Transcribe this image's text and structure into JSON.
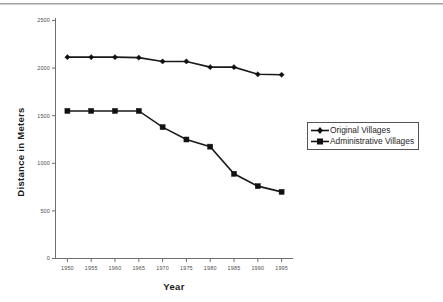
{
  "chart_data": {
    "type": "line",
    "title": "",
    "xlabel": "Year",
    "ylabel": "Distance in Meters",
    "x": [
      1950,
      1955,
      1960,
      1965,
      1970,
      1975,
      1980,
      1985,
      1990,
      1995
    ],
    "categories": [
      "1950",
      "1955",
      "1960",
      "1965",
      "1970",
      "1975",
      "1980",
      "1985",
      "1990",
      "1995"
    ],
    "series": [
      {
        "name": "Original Villages",
        "marker": "diamond",
        "color": "#111111",
        "values": [
          2115,
          2115,
          2115,
          2110,
          2070,
          2070,
          2010,
          2010,
          1935,
          1930
        ]
      },
      {
        "name": "Administrative Villages",
        "marker": "square",
        "color": "#111111",
        "values": [
          1550,
          1550,
          1550,
          1550,
          1380,
          1250,
          1175,
          890,
          760,
          700
        ]
      }
    ],
    "xlim": [
      1947.5,
      1997.5
    ],
    "ylim": [
      0,
      2500
    ],
    "yticks": [
      0,
      500,
      1000,
      1500,
      2000,
      2500
    ],
    "ytick_labels": [
      "0",
      "500",
      "1000",
      "1500",
      "2000",
      "2500"
    ],
    "xticks": [
      1950,
      1955,
      1960,
      1965,
      1970,
      1975,
      1980,
      1985,
      1990,
      1995
    ],
    "grid": false,
    "legend_position": "right"
  },
  "legend": {
    "entries": [
      {
        "label": "Original Villages",
        "marker": "diamond-marker-icon"
      },
      {
        "label": "Administrative Villages",
        "marker": "square-marker-icon"
      }
    ]
  },
  "axis": {
    "y_title": "Distance in Meters",
    "x_title": "Year"
  }
}
